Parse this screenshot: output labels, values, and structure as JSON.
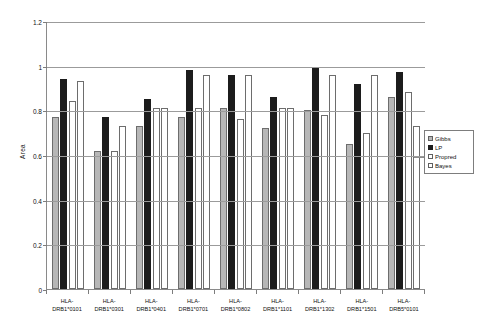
{
  "chart_data": {
    "type": "bar",
    "title": "",
    "xlabel": "",
    "ylabel": "Area",
    "ylim": [
      0,
      1.2
    ],
    "ytick_values": [
      0,
      0.2,
      0.4,
      0.6,
      0.8,
      1,
      1.2
    ],
    "ytick_labels": [
      "0",
      "0.2",
      "0.4",
      "0.6",
      "0.8",
      "1",
      "1.2"
    ],
    "grid": true,
    "legend_position": "right",
    "categories": [
      "HLA-DRB1*0101",
      "HLA-DRB1*0301",
      "HLA-DRB1*0401",
      "HLA-DRB1*0701",
      "HLA-DRB1*0802",
      "HLA-DRB1*1101",
      "HLA-DRB1*1302",
      "HLA-DRB1*1501",
      "HLA-DRB5*0101"
    ],
    "category_lines": [
      [
        "HLA-",
        "DRB1*0101"
      ],
      [
        "HLA-",
        "DRB1*0301"
      ],
      [
        "HLA-",
        "DRB1*0401"
      ],
      [
        "HLA-",
        "DRB1*0701"
      ],
      [
        "HLA-",
        "DRB1*0802"
      ],
      [
        "HLA-",
        "DRB1*1101"
      ],
      [
        "HLA-",
        "DRB1*1302"
      ],
      [
        "HLA-",
        "DRB1*1501"
      ],
      [
        "HLA-",
        "DRB5*0101"
      ]
    ],
    "series": [
      {
        "name": "Gibbs",
        "color": "#b7b7b7",
        "values": [
          0.77,
          0.62,
          0.73,
          0.77,
          0.81,
          0.72,
          0.8,
          0.65,
          0.86
        ]
      },
      {
        "name": "LP",
        "color": "#1c1c1c",
        "values": [
          0.94,
          0.77,
          0.85,
          0.98,
          0.96,
          0.86,
          0.99,
          0.92,
          0.97
        ]
      },
      {
        "name": "Propred",
        "color": "#ffffff",
        "values": [
          0.84,
          0.62,
          0.81,
          0.81,
          0.76,
          0.81,
          0.78,
          0.7,
          0.88
        ]
      },
      {
        "name": "Bayes",
        "color": "#ffffff",
        "values": [
          0.93,
          0.73,
          0.81,
          0.96,
          0.96,
          0.81,
          0.96,
          0.96,
          0.73
        ]
      }
    ]
  },
  "legend": {
    "items": [
      {
        "label": "Gibbs",
        "swatch": "gibbs-swatch"
      },
      {
        "label": "LP",
        "swatch": "lp-swatch"
      },
      {
        "label": "Propred",
        "swatch": "propred-swatch"
      },
      {
        "label": "Bayes",
        "swatch": "bayes-swatch"
      }
    ]
  }
}
